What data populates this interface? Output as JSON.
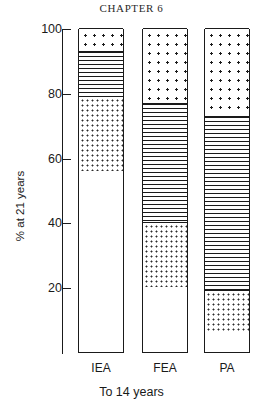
{
  "page": {
    "running_head": "CHAPTER 6"
  },
  "chart_data": {
    "type": "bar",
    "subtype": "stacked-100-percent",
    "title": "",
    "xlabel": "To 14 years",
    "ylabel": "% at 21 years",
    "ylim": [
      0,
      100
    ],
    "yticks": [
      20,
      40,
      60,
      80,
      100
    ],
    "ytick_labels": [
      "20",
      "40",
      "60",
      "80",
      "100"
    ],
    "grid": false,
    "legend": "none",
    "categories": [
      "IEA",
      "FEA",
      "PA"
    ],
    "series": [
      {
        "name": "blank",
        "pattern": "white",
        "values": [
          56,
          20,
          6
        ]
      },
      {
        "name": "fine-dots",
        "pattern": "fine-dots",
        "values": [
          23,
          20,
          13
        ]
      },
      {
        "name": "horiz-lines",
        "pattern": "horizontal-lines",
        "values": [
          14,
          37,
          54
        ]
      },
      {
        "name": "coarse-dots",
        "pattern": "coarse-dots",
        "values": [
          7,
          23,
          27
        ]
      }
    ],
    "stack_boundaries": {
      "IEA": [
        0,
        56,
        79,
        93,
        100
      ],
      "FEA": [
        0,
        20,
        40,
        77,
        100
      ],
      "PA": [
        0,
        6,
        19,
        73,
        100
      ]
    }
  },
  "colors": {
    "ink": "#1a1a1a",
    "paper": "#ffffff"
  }
}
